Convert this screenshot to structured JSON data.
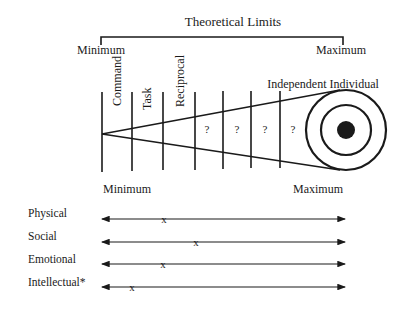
{
  "header": {
    "title": "Theoretical Limits",
    "min_label": "Minimum",
    "max_label": "Maximum"
  },
  "cone": {
    "stage_labels": [
      "Command",
      "Task",
      "Reciprocal"
    ],
    "unknown_labels": [
      "?",
      "?",
      "?",
      "?"
    ],
    "end_label": "Independent Individual"
  },
  "scale": {
    "min_label": "Minimum",
    "max_label": "Maximum"
  },
  "rows": [
    {
      "label": "Physical",
      "mark": "x",
      "position": 0.26
    },
    {
      "label": "Social",
      "mark": "x",
      "position": 0.39
    },
    {
      "label": "Emotional",
      "mark": "x",
      "position": 0.25
    },
    {
      "label": "Intellectual*",
      "mark": "x",
      "position": 0.12
    }
  ],
  "colors": {
    "ink": "#1a1a1a",
    "background": "#ffffff"
  }
}
